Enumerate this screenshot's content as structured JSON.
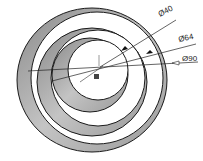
{
  "diagram": {
    "type": "concentric-rings-cad",
    "rings": [
      {
        "label": "outer-ring",
        "diameter": 90
      },
      {
        "label": "middle-ring",
        "diameter": 64
      },
      {
        "label": "inner-ring",
        "diameter": 40
      }
    ],
    "dimensions": [
      {
        "symbol": "Ø",
        "value": "40",
        "text": "Ø40"
      },
      {
        "symbol": "Ø",
        "value": "64",
        "text": "Ø64"
      },
      {
        "symbol": "Ø",
        "value": "90",
        "text": "Ø90"
      }
    ],
    "colors": {
      "ring_fill": "#a8a8a8",
      "ring_dark": "#7a7a7a",
      "outline": "#1a1a1a",
      "background": "#ffffff"
    }
  }
}
